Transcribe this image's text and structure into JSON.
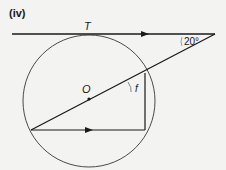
{
  "figure": {
    "part_label": "(iv)",
    "point_T": "T",
    "point_O": "O",
    "angle_label": "f",
    "given_angle": "20°"
  },
  "colors": {
    "ink": "#1a1a1a",
    "circle": "#4a4a4a",
    "background": "#f3f3f1"
  }
}
